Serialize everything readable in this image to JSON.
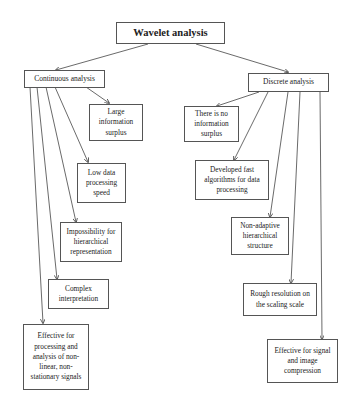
{
  "diagram": {
    "root": {
      "id": "root",
      "label": "Wavelet analysis"
    },
    "branches": [
      {
        "id": "continuous",
        "label": "Continuous analysis",
        "children": [
          {
            "id": "c1",
            "label": "Large information surplus"
          },
          {
            "id": "c2",
            "label": "Low data processing speed"
          },
          {
            "id": "c3",
            "label": "Impossibility for hierarchical representation"
          },
          {
            "id": "c4",
            "label": "Complex interpretation"
          },
          {
            "id": "c5",
            "label": "Effective for processing and analysis of non-linear, non-stationary signals"
          }
        ]
      },
      {
        "id": "discrete",
        "label": "Discrete analysis",
        "children": [
          {
            "id": "d1",
            "label": "There is no information surplus"
          },
          {
            "id": "d2",
            "label": "Developed fast algorithms for data processing"
          },
          {
            "id": "d3",
            "label": "Non-adaptive hierarchical structure"
          },
          {
            "id": "d4",
            "label": "Rough resolution on the scaling scale"
          },
          {
            "id": "d5",
            "label": "Effective for signal and image compression"
          }
        ]
      }
    ],
    "colors": {
      "line": "#444444",
      "border": "#555555",
      "text": "#222222",
      "background": "#ffffff"
    }
  }
}
